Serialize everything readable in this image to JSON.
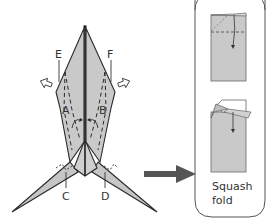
{
  "diagram": {
    "type": "origami-instruction",
    "labels": {
      "E": "E",
      "F": "F",
      "A": "A",
      "B": "B",
      "C": "C",
      "D": "D"
    },
    "inset": {
      "caption_line1": "Squash",
      "caption_line2": "fold"
    },
    "colors": {
      "paper": "#c8c8c8",
      "paper_light": "#d6d6d6",
      "outline": "#2a2a2a",
      "arrow": "#555555",
      "box": "#555555"
    }
  }
}
